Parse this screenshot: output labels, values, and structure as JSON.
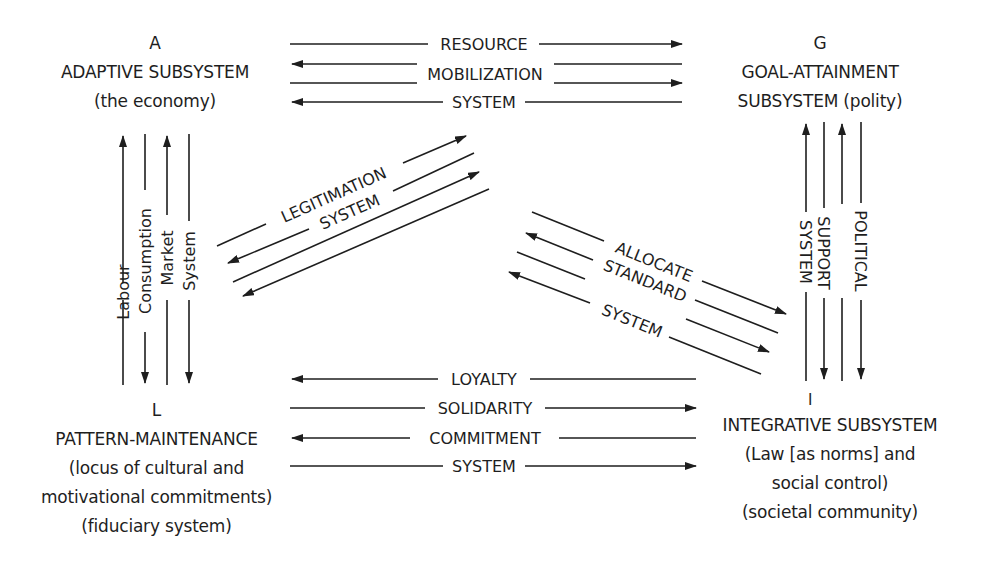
{
  "diagram": {
    "colors": {
      "ink": "#1e1e1e",
      "background": "#ffffff"
    },
    "nodes": {
      "A": {
        "letter": "A",
        "name": "ADAPTIVE SUBSYSTEM",
        "desc": [
          "(the economy)"
        ]
      },
      "G": {
        "letter": "G",
        "name": "GOAL-ATTAINMENT",
        "desc": [
          "SUBSYSTEM (polity)"
        ]
      },
      "L": {
        "letter": "L",
        "name": "PATTERN-MAINTENANCE",
        "desc": [
          "(locus of cultural and",
          "motivational commitments)",
          "(fiduciary system)"
        ]
      },
      "I": {
        "letter": "I",
        "name": "INTEGRATIVE SUBSYSTEM",
        "desc": [
          "(Law [as norms] and",
          "social control)",
          "(societal community)"
        ]
      }
    },
    "interchanges": {
      "A_G": {
        "labels": [
          "RESOURCE",
          "MOBILIZATION",
          "SYSTEM"
        ],
        "arrows": [
          "right",
          "left",
          "right",
          "left"
        ]
      },
      "A_L": {
        "labels": [
          "Labour",
          "Consumption",
          "Market",
          "System"
        ],
        "arrows": [
          "up",
          "down",
          "up",
          "down"
        ]
      },
      "L_G": {
        "labels": [
          "LEGITIMATION",
          "SYSTEM"
        ],
        "arrows": [
          "up-right",
          "down-left",
          "up-right",
          "down-left"
        ]
      },
      "G_I": {
        "labels": [
          "SYSTEM",
          "SUPPORT",
          "POLITICAL"
        ],
        "arrows": [
          "up",
          "down",
          "up",
          "down"
        ]
      },
      "A_I": {
        "labels": [
          "ALLOCATE",
          "STANDARD",
          "SYSTEM"
        ],
        "arrows": [
          "down-right",
          "up-left",
          "down-right",
          "up-left"
        ]
      },
      "L_I": {
        "labels": [
          "LOYALTY",
          "SOLIDARITY",
          "COMMITMENT",
          "SYSTEM"
        ],
        "arrows": [
          "left",
          "right",
          "left",
          "right"
        ]
      }
    }
  }
}
